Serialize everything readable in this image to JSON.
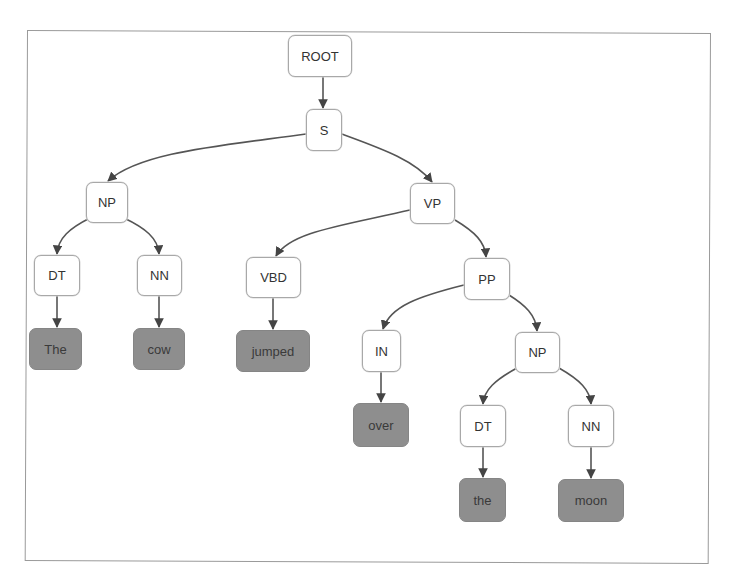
{
  "diagram": {
    "type": "constituency-parse-tree",
    "sentence": "The cow jumped over the moon",
    "colors": {
      "internal_fill": "#ffffff",
      "internal_border": "#a8a8a8",
      "leaf_fill": "#8e8e8e",
      "edge": "#444444",
      "frame_border": "#9a9a9a"
    },
    "nodes": {
      "root": {
        "label": "ROOT",
        "kind": "internal",
        "x": 288,
        "y": 35,
        "w": 64,
        "h": 42
      },
      "s": {
        "label": "S",
        "kind": "internal",
        "x": 306,
        "y": 109,
        "w": 36,
        "h": 42
      },
      "np1": {
        "label": "NP",
        "kind": "internal",
        "x": 86,
        "y": 182,
        "w": 42,
        "h": 41
      },
      "vp": {
        "label": "VP",
        "kind": "internal",
        "x": 410,
        "y": 183,
        "w": 45,
        "h": 41
      },
      "dt1": {
        "label": "DT",
        "kind": "internal",
        "x": 34,
        "y": 255,
        "w": 46,
        "h": 41
      },
      "nn1": {
        "label": "NN",
        "kind": "internal",
        "x": 137,
        "y": 255,
        "w": 45,
        "h": 41
      },
      "vbd": {
        "label": "VBD",
        "kind": "internal",
        "x": 246,
        "y": 257,
        "w": 55,
        "h": 41
      },
      "pp": {
        "label": "PP",
        "kind": "internal",
        "x": 464,
        "y": 258,
        "w": 46,
        "h": 42
      },
      "the1": {
        "label": "The",
        "kind": "leaf",
        "x": 29,
        "y": 328,
        "w": 53,
        "h": 42
      },
      "cow": {
        "label": "cow",
        "kind": "leaf",
        "x": 133,
        "y": 328,
        "w": 52,
        "h": 42
      },
      "jumped": {
        "label": "jumped",
        "kind": "leaf",
        "x": 236,
        "y": 330,
        "w": 74,
        "h": 42
      },
      "in": {
        "label": "IN",
        "kind": "internal",
        "x": 362,
        "y": 330,
        "w": 39,
        "h": 42
      },
      "np2": {
        "label": "NP",
        "kind": "internal",
        "x": 515,
        "y": 332,
        "w": 45,
        "h": 41
      },
      "over": {
        "label": "over",
        "kind": "leaf",
        "x": 353,
        "y": 403,
        "w": 56,
        "h": 44
      },
      "dt2": {
        "label": "DT",
        "kind": "internal",
        "x": 460,
        "y": 405,
        "w": 46,
        "h": 42
      },
      "nn2": {
        "label": "NN",
        "kind": "internal",
        "x": 568,
        "y": 405,
        "w": 46,
        "h": 42
      },
      "the2": {
        "label": "the",
        "kind": "leaf",
        "x": 459,
        "y": 478,
        "w": 47,
        "h": 44
      },
      "moon": {
        "label": "moon",
        "kind": "leaf",
        "x": 558,
        "y": 479,
        "w": 66,
        "h": 43
      }
    },
    "edges": [
      {
        "from": "ROOT",
        "to": "S"
      },
      {
        "from": "S",
        "to": "NP"
      },
      {
        "from": "S",
        "to": "VP"
      },
      {
        "from": "NP",
        "to": "DT"
      },
      {
        "from": "NP",
        "to": "NN"
      },
      {
        "from": "DT",
        "to": "The"
      },
      {
        "from": "NN",
        "to": "cow"
      },
      {
        "from": "VP",
        "to": "VBD"
      },
      {
        "from": "VP",
        "to": "PP"
      },
      {
        "from": "VBD",
        "to": "jumped"
      },
      {
        "from": "PP",
        "to": "IN"
      },
      {
        "from": "PP",
        "to": "NP"
      },
      {
        "from": "IN",
        "to": "over"
      },
      {
        "from": "NP",
        "to": "DT"
      },
      {
        "from": "NP",
        "to": "NN"
      },
      {
        "from": "DT",
        "to": "the"
      },
      {
        "from": "NN",
        "to": "moon"
      }
    ]
  }
}
